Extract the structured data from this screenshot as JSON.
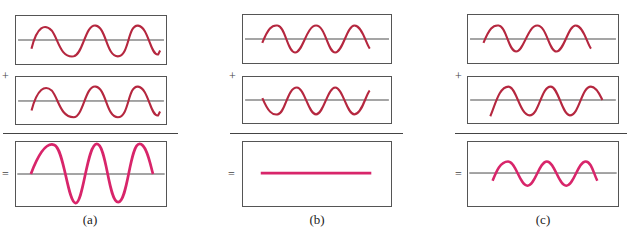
{
  "figure": {
    "colors": {
      "input_wave": "#b5273f",
      "result_wave": "#d8256a",
      "axis": "#444444",
      "border": "#555555"
    },
    "operators": {
      "plus": "+",
      "equals": "="
    },
    "panels": [
      {
        "id": "a",
        "caption": "(a)",
        "wave1": {
          "amplitude": 1.0,
          "phase_deg": 0,
          "cycles": 3
        },
        "wave2": {
          "amplitude": 1.0,
          "phase_deg": 0,
          "cycles": 3
        },
        "result": {
          "amplitude": 2.0,
          "label": "constructive"
        }
      },
      {
        "id": "b",
        "caption": "(b)",
        "wave1": {
          "amplitude": 1.0,
          "phase_deg": 0,
          "cycles": 3
        },
        "wave2": {
          "amplitude": 1.0,
          "phase_deg": 180,
          "cycles": 3
        },
        "result": {
          "amplitude": 0.0,
          "label": "destructive"
        }
      },
      {
        "id": "c",
        "caption": "(c)",
        "wave1": {
          "amplitude": 1.0,
          "phase_deg": 0,
          "cycles": 3
        },
        "wave2": {
          "amplitude": 1.0,
          "phase_deg": 60,
          "cycles": 3
        },
        "result": {
          "amplitude": 0.7,
          "label": "partial"
        }
      }
    ]
  }
}
